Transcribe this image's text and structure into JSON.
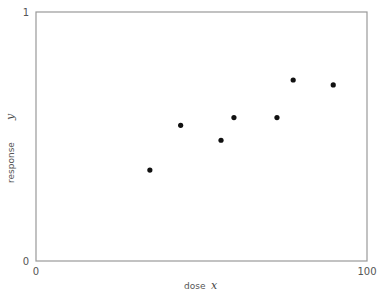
{
  "chart_data": {
    "type": "scatter",
    "title": "",
    "xlabel": "dose",
    "xlabel_var": "x",
    "ylabel": "response",
    "ylabel_var": "y",
    "xlim": [
      0,
      100
    ],
    "ylim": [
      0,
      1
    ],
    "x_ticks": [
      "0",
      "100"
    ],
    "y_ticks": [
      "0",
      "1"
    ],
    "grid": false,
    "legend": null,
    "series": [
      {
        "name": "observations",
        "color": "#111111",
        "points": [
          {
            "x": 34.4,
            "y": 0.365
          },
          {
            "x": 43.7,
            "y": 0.545
          },
          {
            "x": 55.9,
            "y": 0.485
          },
          {
            "x": 59.8,
            "y": 0.576
          },
          {
            "x": 72.8,
            "y": 0.576
          },
          {
            "x": 77.7,
            "y": 0.727
          },
          {
            "x": 89.8,
            "y": 0.707
          }
        ]
      }
    ]
  },
  "axes": {
    "x_tick_min": "0",
    "x_tick_max": "100",
    "y_tick_min": "0",
    "y_tick_max": "1",
    "x_label": "dose",
    "x_var": "x",
    "y_label": "response",
    "y_var": "y"
  },
  "style": {
    "frame_color": "#999999",
    "point_color": "#111111"
  }
}
